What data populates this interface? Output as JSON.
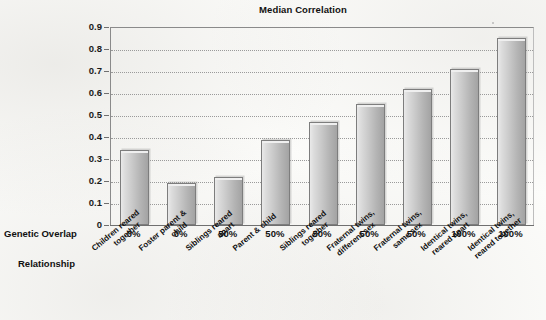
{
  "chart_data": {
    "type": "bar",
    "title": "Median Correlation",
    "xlabel": "",
    "ylabel": "",
    "ylim": [
      0,
      0.9
    ],
    "grid": true,
    "legend": null,
    "yticks": [
      "0.9",
      "0.8",
      "0.7",
      "0.6",
      "0.5",
      "0.4",
      "0.3",
      "0.2",
      "0.1",
      "0"
    ],
    "ytick_values": [
      0.9,
      0.8,
      0.7,
      0.6,
      0.5,
      0.4,
      0.3,
      0.2,
      0.1,
      0
    ],
    "categories": [
      "Children reared together",
      "Foster parent & child",
      "Siblings reared apart",
      "Parent & child",
      "Siblings reared together",
      "Fraternal twins, different sex",
      "Fraternal twins, same sex",
      "Identical twins, reared apart",
      "Identical twins, reared together"
    ],
    "values": [
      0.34,
      0.19,
      0.22,
      0.385,
      0.47,
      0.55,
      0.62,
      0.71,
      0.85
    ],
    "genetic_overlap": [
      "0%",
      "0%",
      "50%",
      "50%",
      "50%",
      "50%",
      "50%",
      "100%",
      "100%"
    ]
  },
  "axis_rows": {
    "genetic_overlap_label": "Genetic Overlap",
    "relationship_label": "Relationship"
  },
  "category_lines": [
    [
      "Children reared",
      "together"
    ],
    [
      "Foster parent &",
      "child"
    ],
    [
      "Siblings reared",
      "apart"
    ],
    [
      "Parent & child"
    ],
    [
      "Siblings reared",
      "together"
    ],
    [
      "Fraternal twins,",
      "different sex"
    ],
    [
      "Fraternal twins,",
      "same sex"
    ],
    [
      "Identical twins,",
      "reared apart"
    ],
    [
      "Identical twins,",
      "reared together"
    ]
  ],
  "colors": {
    "bar_light": "#e9e9e9",
    "bar_dark": "#a3a3a3",
    "bar_border": "#7d7d7d",
    "axis": "#6f6f6f",
    "gridline": "#9a9a9a",
    "text": "#111111",
    "page_background": "#fcfcfa"
  }
}
